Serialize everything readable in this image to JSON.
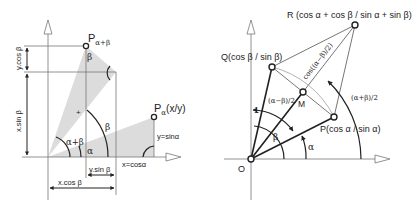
{
  "left_diagram": {
    "points": {
      "p_alpha_beta": {
        "label_main": "P",
        "label_sub": "α+β"
      },
      "p_alpha": {
        "label_main": "P",
        "label_sub": "α",
        "label_suffix": "(x/y)"
      }
    },
    "labels": {
      "y_cos_beta": "y.cos β",
      "x_sin_beta": "x.sin β",
      "y_sin_beta": "y.sin β",
      "x_cos_beta": "x.cos β",
      "x_cos_alpha": "x=cosα",
      "y_sin_alpha": "y=sinα",
      "beta_top": "β",
      "beta_mid": "β",
      "alpha": "α",
      "alpha_plus_beta": "α+β",
      "plus_mark": "+"
    },
    "colors": {
      "shade": "#dcdcdc",
      "line": "#555555",
      "arrow": "#222222"
    }
  },
  "right_diagram": {
    "points": {
      "o": "O",
      "p": "P(cos α / sin α)",
      "q": "Q(cos β / sin β)",
      "r": "R  (cos α + cos β / sin α  + sin β)",
      "m": "M"
    },
    "labels": {
      "one": "1",
      "half_diff": "(α−β)/2",
      "half_sum": "(α+β)/2",
      "cos_half_diff": "cos((α−β)/2)",
      "beta": "β",
      "alpha": "α"
    }
  }
}
